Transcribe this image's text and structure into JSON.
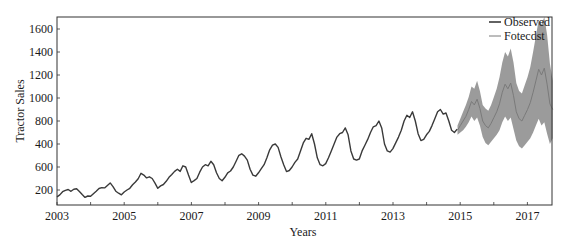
{
  "chart_data": {
    "type": "line",
    "title": "",
    "xlabel": "Years",
    "ylabel": "Tractor Sales",
    "xlim": [
      2003,
      2017.75
    ],
    "ylim": [
      80,
      1700
    ],
    "grid": false,
    "legend_position": "upper right",
    "x_ticks": [
      "2003",
      "2005",
      "2007",
      "2009",
      "2011",
      "2013",
      "2015",
      "2017"
    ],
    "y_ticks_printed": [
      "1600",
      "1400",
      "1200",
      "1000",
      "800",
      "400",
      "600",
      "200"
    ],
    "y_tick_positions_value": [
      1600,
      1400,
      1200,
      1000,
      800,
      600,
      400,
      200
    ],
    "legend": [
      "Observed",
      "Fotecdst"
    ],
    "colors": {
      "observed": "#3a3a3a",
      "forecast": "#7a7a7a",
      "band": "#8a8a8a",
      "frame": "#333333"
    },
    "series": [
      {
        "name": "Observed",
        "x_start": 2003.0,
        "x_step": 0.0833,
        "values": [
          141,
          157,
          185,
          197,
          204,
          189,
          207,
          210,
          186,
          160,
          136,
          148,
          145,
          168,
          190,
          213,
          220,
          218,
          240,
          262,
          230,
          190,
          172,
          158,
          183,
          200,
          215,
          245,
          270,
          298,
          345,
          330,
          305,
          315,
          300,
          260,
          215,
          236,
          248,
          276,
          310,
          335,
          362,
          380,
          362,
          410,
          400,
          330,
          265,
          282,
          300,
          355,
          400,
          420,
          410,
          450,
          420,
          350,
          300,
          280,
          310,
          350,
          365,
          400,
          450,
          502,
          515,
          495,
          460,
          380,
          330,
          320,
          350,
          385,
          420,
          480,
          550,
          590,
          600,
          570,
          490,
          420,
          360,
          370,
          400,
          440,
          470,
          540,
          610,
          650,
          640,
          690,
          600,
          480,
          420,
          410,
          430,
          480,
          540,
          600,
          660,
          690,
          700,
          740,
          680,
          540,
          470,
          460,
          470,
          540,
          590,
          640,
          700,
          750,
          760,
          800,
          740,
          600,
          540,
          530,
          560,
          610,
          660,
          720,
          800,
          850,
          830,
          880,
          800,
          690,
          630,
          640,
          680,
          710,
          760,
          820,
          880,
          900,
          860,
          870,
          800,
          720,
          700,
          730
        ]
      },
      {
        "name": "Fotecdst",
        "x_start": 2014.92,
        "x_step": 0.0833,
        "values": [
          720,
          760,
          800,
          840,
          900,
          970,
          940,
          990,
          910,
          800,
          760,
          740,
          780,
          830,
          880,
          950,
          1050,
          1120,
          1080,
          1130,
          1020,
          880,
          820,
          800,
          850,
          900,
          960,
          1050,
          1150,
          1250,
          1200,
          1260,
          1120,
          950,
          900
        ],
        "lower": [
          680,
          700,
          720,
          750,
          790,
          840,
          800,
          830,
          760,
          660,
          610,
          590,
          620,
          650,
          680,
          720,
          790,
          840,
          800,
          830,
          730,
          630,
          580,
          560,
          590,
          620,
          650,
          700,
          760,
          820,
          760,
          790,
          690,
          600,
          650
        ],
        "upper": [
          760,
          820,
          880,
          940,
          1010,
          1100,
          1080,
          1150,
          1060,
          940,
          910,
          890,
          940,
          1010,
          1080,
          1180,
          1310,
          1400,
          1360,
          1430,
          1310,
          1130,
          1060,
          1040,
          1110,
          1180,
          1270,
          1400,
          1540,
          1680,
          1640,
          1730,
          1550,
          1300,
          1150
        ]
      }
    ]
  }
}
